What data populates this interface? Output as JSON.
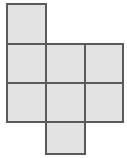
{
  "figure": {
    "canvas": {
      "width": 127,
      "height": 158
    },
    "background_color": "#ffffff"
  },
  "style": {
    "face_fill": "#e3e3e3",
    "face_stroke": "#5a5a5a",
    "stroke_width": 1.6
  },
  "grid": {
    "columns_x": [
      7,
      46,
      85,
      123
    ],
    "rows_y": [
      4,
      44,
      83,
      122,
      154
    ],
    "cell_width": 39,
    "cell_height": 39
  },
  "chart_data": {
    "type": "diagram",
    "faces": [
      {
        "id": "face-top",
        "label": "",
        "col": 0,
        "row": 0,
        "x": 7,
        "y": 4,
        "width": 39,
        "height": 40
      },
      {
        "id": "face-upper-left",
        "label": "",
        "col": 0,
        "row": 1,
        "x": 7,
        "y": 44,
        "width": 39,
        "height": 39
      },
      {
        "id": "face-upper-middle",
        "label": "",
        "col": 1,
        "row": 1,
        "x": 46,
        "y": 44,
        "width": 39,
        "height": 39
      },
      {
        "id": "face-upper-right",
        "label": "",
        "col": 2,
        "row": 1,
        "x": 85,
        "y": 44,
        "width": 38,
        "height": 39
      },
      {
        "id": "face-lower-left",
        "label": "",
        "col": 0,
        "row": 2,
        "x": 7,
        "y": 83,
        "width": 39,
        "height": 39
      },
      {
        "id": "face-lower-middle",
        "label": "",
        "col": 1,
        "row": 2,
        "x": 46,
        "y": 83,
        "width": 39,
        "height": 39
      },
      {
        "id": "face-lower-right",
        "label": "",
        "col": 2,
        "row": 2,
        "x": 85,
        "y": 83,
        "width": 38,
        "height": 39
      },
      {
        "id": "face-bottom",
        "label": "",
        "col": 1,
        "row": 3,
        "x": 46,
        "y": 122,
        "width": 39,
        "height": 32
      }
    ],
    "face_count": 6,
    "shape": "cross"
  }
}
